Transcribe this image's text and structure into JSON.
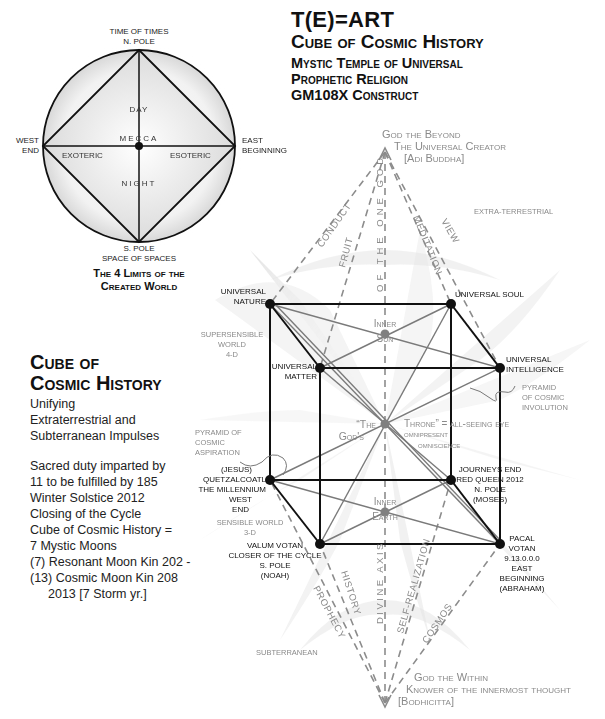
{
  "header": {
    "title": "T(E)=ART",
    "subtitle": "Cube of Cosmic History",
    "lines": [
      "Mystic Temple of Universal",
      "Prophetic Religion",
      "GM108X Construct"
    ]
  },
  "circle_diagram": {
    "top_label_1": "TIME OF TIMES",
    "top_label_2": "N. POLE",
    "bottom_label_1": "S. POLE",
    "bottom_label_2": "SPACE OF SPACES",
    "left_label_1": "WEST",
    "left_label_2": "END",
    "right_label_1": "EAST",
    "right_label_2": "BEGINNING",
    "center_label": "MECCA",
    "day": "DAY",
    "night": "NIGHT",
    "exoteric": "EXOTERIC",
    "esoteric": "ESOTERIC",
    "caption_1": "The 4 Limits of the",
    "caption_2": "Created World"
  },
  "side_panel": {
    "title_1": "Cube of",
    "title_2": "Cosmic History",
    "intro": [
      "Unifying",
      "Extraterrestrial and",
      "Subterranean Impulses"
    ],
    "body": [
      "Sacred duty imparted by",
      "11 to be fulfilled by 185",
      "Winter Solstice 2012",
      "Closing of the Cycle",
      "Cube of Cosmic History =",
      "7 Mystic Moons",
      "(7) Resonant Moon Kin 202 -",
      "(13) Cosmic Moon Kin 208",
      "     2013 [7 Storm yr.]"
    ]
  },
  "cube": {
    "top_apex": [
      "God the Beyond",
      "The Universal Creator",
      "[Adi Buddha]"
    ],
    "bottom_apex": [
      "God the Within",
      "Knower of the innermost thought",
      "[Bodhicitta]"
    ],
    "extra_terrestrial": "EXTRA-TERRESTRIAL",
    "subterranean": "SUBTERRANEAN",
    "upper_paths": [
      "CONDUCT",
      "FRUIT",
      "OF THE ONE GOD",
      "MEDITATION",
      "VIEW"
    ],
    "lower_paths": [
      "PROPHECY",
      "HISTORY",
      "DIVINE AXIS",
      "SELF-REALIZATION",
      "COSMOS"
    ],
    "vertices": {
      "universal_nature": [
        "UNIVERSAL",
        "NATURE"
      ],
      "universal_soul": [
        "UNIVERSAL SOUL"
      ],
      "universal_matter": [
        "UNIVERSAL",
        "MATTER"
      ],
      "universal_intelligence": [
        "UNIVERSAL",
        "INTELLIGENCE"
      ],
      "quetzalcoatl": [
        "(JESUS)",
        "QUETZALCOATL",
        "THE MILLENNIUM",
        "WEST",
        "END"
      ],
      "journeys_end": [
        "JOURNEYS END",
        "RED QUEEN 2012",
        "N. POLE",
        "(MOSES)"
      ],
      "valum_votan": [
        "VALUM VOTAN",
        "CLOSER OF THE CYCLE",
        "S. POLE",
        "(NOAH)"
      ],
      "pacal_votan": [
        "PACAL",
        "VOTAN",
        "9.13.0.0.0",
        "EAST",
        "BEGINNING",
        "(ABRAHAM)"
      ]
    },
    "inner_sun": [
      "Inner",
      "Sun"
    ],
    "inner_earth": [
      "Inner",
      "Earth"
    ],
    "center_left": [
      "“The",
      "God's"
    ],
    "center_right": [
      "Throne” = all-seeing eye",
      "omnipresent",
      "omniscience"
    ],
    "supersensible": [
      "SUPERSENSIBLE",
      "WORLD",
      "4-D"
    ],
    "sensible": [
      "SENSIBLE WORLD",
      "3-D"
    ],
    "pyramid_aspiration": [
      "PYRAMID OF",
      "COSMIC",
      "ASPIRATION"
    ],
    "pyramid_involution": [
      "PYRAMID",
      "OF COSMIC",
      "INVOLUTION"
    ]
  },
  "colors": {
    "ink": "#111111",
    "grey_text": "#8a8a8a",
    "grey_line": "#7a7a7a",
    "dash_line": "#8c8c8c",
    "node_grey": "#808080"
  }
}
